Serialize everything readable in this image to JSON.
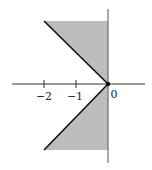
{
  "diagram": {
    "type": "complex-plane-sector",
    "fill_color": "#bdbdbd",
    "line_color": "#111111",
    "axis_color": "#333333",
    "tick_labels": {
      "neg2": "−2",
      "neg1": "−1",
      "zero": "0"
    }
  }
}
